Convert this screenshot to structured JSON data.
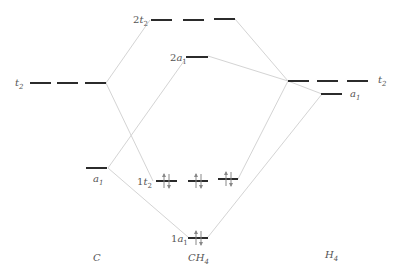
{
  "diagram": {
    "columns": {
      "left": "C",
      "center": {
        "base": "CH",
        "sub": "4"
      },
      "right": {
        "base": "H",
        "sub": "4"
      }
    },
    "levels": {
      "c_t2": {
        "prefix": "",
        "sym": "t",
        "sub": "2"
      },
      "c_a1": {
        "prefix": "",
        "sym": "a",
        "sub": "1"
      },
      "m_2t2": {
        "prefix": "2",
        "sym": "t",
        "sub": "2"
      },
      "m_2a1": {
        "prefix": "2",
        "sym": "a",
        "sub": "1"
      },
      "m_1t2": {
        "prefix": "1",
        "sym": "t",
        "sub": "2",
        "electrons": 6
      },
      "m_1a1": {
        "prefix": "1",
        "sym": "a",
        "sub": "1",
        "electrons": 2
      },
      "h_t2": {
        "prefix": "",
        "sym": "t",
        "sub": "2"
      },
      "h_a1": {
        "prefix": "",
        "sym": "a",
        "sub": "1"
      }
    }
  }
}
